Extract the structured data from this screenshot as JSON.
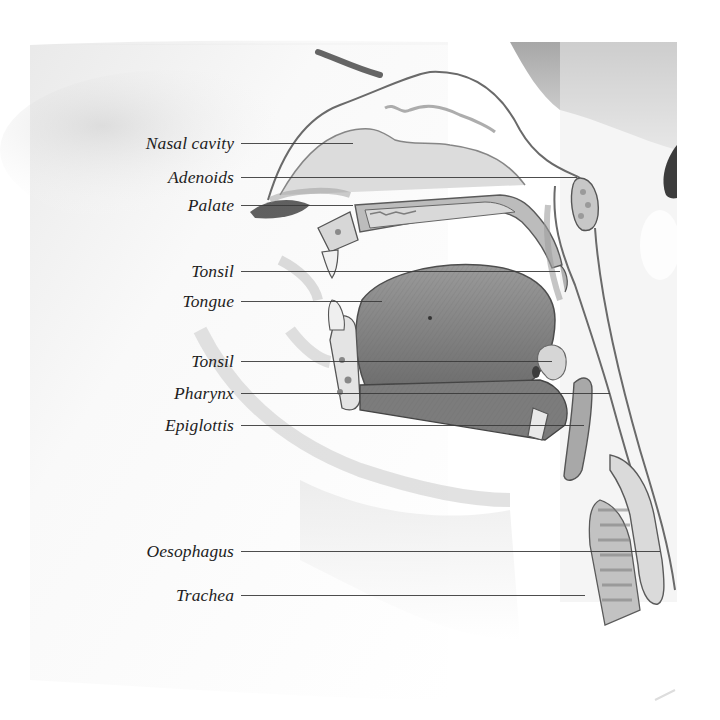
{
  "diagram": {
    "colors": {
      "background": "#ffffff",
      "label_text": "#1e1e1e",
      "leader_line": "#3a3a3a",
      "tissue_light": "#e4e4e4",
      "tissue_mid": "#bdbdbd",
      "tissue_dark": "#7a7a7a",
      "outline": "#555555"
    },
    "labels": [
      {
        "id": "nasal-cavity",
        "text": "Nasal cavity",
        "y": 143,
        "line_end_x": 353
      },
      {
        "id": "adenoids",
        "text": "Adenoids",
        "y": 177,
        "line_end_x": 577
      },
      {
        "id": "palate",
        "text": "Palate",
        "y": 205,
        "line_end_x": 353
      },
      {
        "id": "tonsil-upper",
        "text": "Tonsil",
        "y": 271,
        "line_end_x": 560
      },
      {
        "id": "tongue",
        "text": "Tongue",
        "y": 301,
        "line_end_x": 382
      },
      {
        "id": "tonsil-lower",
        "text": "Tonsil",
        "y": 361,
        "line_end_x": 552
      },
      {
        "id": "pharynx",
        "text": "Pharynx",
        "y": 393,
        "line_end_x": 610
      },
      {
        "id": "epiglottis",
        "text": "Epiglottis",
        "y": 425,
        "line_end_x": 584
      },
      {
        "id": "oesophagus",
        "text": "Oesophagus",
        "y": 551,
        "line_end_x": 660
      },
      {
        "id": "trachea",
        "text": "Trachea",
        "y": 595,
        "line_end_x": 585
      }
    ],
    "leader_line_start_x": 241
  }
}
